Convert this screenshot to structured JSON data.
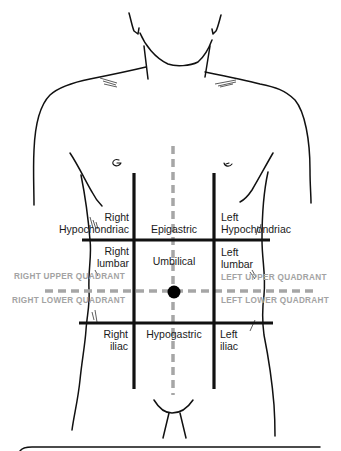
{
  "diagram": {
    "colors": {
      "outline": "#111111",
      "grid_lines": "#111111",
      "midlines": "#a6a6a6",
      "quadrant_text": "#a3a3a3",
      "region_text": "#1a1a1a",
      "umbilicus_dot": "#000000"
    },
    "regions": {
      "right_hypochondriac": {
        "line1": "Right",
        "line2": "Hypochondriac"
      },
      "epigastric": {
        "line1": "Epigastric"
      },
      "left_hypochondriac": {
        "line1": "Left",
        "line2": "Hypochondriac"
      },
      "right_lumbar": {
        "line1": "Right",
        "line2": "lumbar"
      },
      "umbilical": {
        "line1": "Umbilical"
      },
      "left_lumbar": {
        "line1": "Left",
        "line2": "lumbar"
      },
      "right_iliac": {
        "line1": "Right",
        "line2": "iliac"
      },
      "hypogastric": {
        "line1": "Hypogastric"
      },
      "left_iliac": {
        "line1": "Left",
        "line2": "iliac"
      }
    },
    "quadrants": {
      "right_upper": "RIGHT UPPER QUADRANT",
      "left_upper": "LEFT UPPER QUADRANT",
      "right_lower": "RIGHT LOWER QUADRANT",
      "left_lower": "LEFT LOWER QUADRAHT"
    },
    "markers": {
      "umbilicus": "umbilicus-dot"
    }
  }
}
